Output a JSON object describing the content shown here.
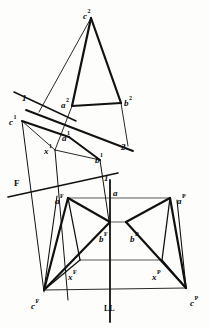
{
  "figure": {
    "ink_color": "#111111",
    "paper_color": "#fdfdfc",
    "width": 210,
    "height": 327
  },
  "labels": [
    {
      "id": "c2",
      "base": "c",
      "sup": "2",
      "x": 83,
      "y": 6,
      "italic": true
    },
    {
      "id": "a2",
      "base": "a",
      "sup": "2",
      "x": 61,
      "y": 95,
      "italic": true
    },
    {
      "id": "b2",
      "base": "b",
      "sup": "2",
      "x": 124,
      "y": 93,
      "italic": true
    },
    {
      "id": "one-upper",
      "base": "1",
      "sup": "",
      "x": 22,
      "y": 88,
      "italic": true
    },
    {
      "id": "c1",
      "base": "c",
      "sup": "1",
      "x": 9,
      "y": 112,
      "italic": true
    },
    {
      "id": "a1",
      "base": "a",
      "sup": "1",
      "x": 62,
      "y": 128,
      "italic": true
    },
    {
      "id": "x1",
      "base": "x",
      "sup": "1",
      "x": 44,
      "y": 141,
      "italic": true
    },
    {
      "id": "b1",
      "base": "b",
      "sup": "1",
      "x": 95,
      "y": 150,
      "italic": true
    },
    {
      "id": "two",
      "base": "2",
      "sup": "",
      "x": 121,
      "y": 137,
      "italic": true
    },
    {
      "id": "F-trace",
      "base": "F",
      "sup": "",
      "x": 14,
      "y": 173,
      "italic": false
    },
    {
      "id": "one-lower",
      "base": "1",
      "sup": "",
      "x": 104,
      "y": 168,
      "italic": true
    },
    {
      "id": "a-plain",
      "base": "a",
      "sup": "",
      "x": 113,
      "y": 183,
      "italic": true
    },
    {
      "id": "aF",
      "base": "a",
      "sup": "F",
      "x": 55,
      "y": 191,
      "italic": true
    },
    {
      "id": "aP",
      "base": "a",
      "sup": "P",
      "x": 177,
      "y": 191,
      "italic": true
    },
    {
      "id": "bF",
      "base": "b",
      "sup": "F",
      "x": 99,
      "y": 229,
      "italic": true
    },
    {
      "id": "bP",
      "base": "b",
      "sup": "P",
      "x": 130,
      "y": 229,
      "italic": true
    },
    {
      "id": "xF",
      "base": "x",
      "sup": "F",
      "x": 68,
      "y": 267,
      "italic": true
    },
    {
      "id": "xP",
      "base": "x",
      "sup": "P",
      "x": 152,
      "y": 267,
      "italic": true
    },
    {
      "id": "cF",
      "base": "c",
      "sup": "F",
      "x": 31,
      "y": 296,
      "italic": true
    },
    {
      "id": "cP",
      "base": "c",
      "sup": "P",
      "x": 190,
      "y": 293,
      "italic": true
    },
    {
      "id": "LL",
      "base": "LL",
      "sup": "",
      "x": 104,
      "y": 298,
      "italic": false
    }
  ],
  "chart_data": {
    "type": "diagram",
    "views": [
      {
        "name": "view-2",
        "note": "upper auxiliary view",
        "points": {
          "c2": [
            91,
            18
          ],
          "a2": [
            72,
            106
          ],
          "b2": [
            121,
            103
          ],
          "x2": [
            39,
            112
          ]
        },
        "edges": [
          [
            "c2",
            "a2",
            "heavy"
          ],
          [
            "c2",
            "b2",
            "heavy"
          ],
          [
            "a2",
            "b2",
            "heavy"
          ],
          [
            "c2",
            "x2",
            "light"
          ],
          [
            "a2",
            "x2",
            "light"
          ]
        ]
      },
      {
        "name": "view-1",
        "note": "lower auxiliary view",
        "points": {
          "c1": [
            22,
            121
          ],
          "a1": [
            69,
            137
          ],
          "b1": [
            100,
            160
          ],
          "x1": [
            55,
            150
          ],
          "p2": [
            128,
            146
          ]
        },
        "edges": [
          [
            "c1",
            "a1",
            "heavy"
          ],
          [
            "a1",
            "b1",
            "heavy"
          ],
          [
            "c1",
            "x1",
            "light"
          ],
          [
            "x1",
            "b1",
            "light"
          ]
        ]
      },
      {
        "name": "view-F",
        "note": "front view",
        "points": {
          "aF": [
            68,
            198
          ],
          "bF": [
            110,
            222
          ],
          "cF": [
            44,
            290
          ],
          "xF": [
            80,
            260
          ]
        },
        "edges": [
          [
            "aF",
            "bF",
            "heavy"
          ],
          [
            "aF",
            "cF",
            "heavy"
          ],
          [
            "bF",
            "cF",
            "heavy"
          ],
          [
            "aF",
            "xF",
            "light"
          ],
          [
            "xF",
            "cF",
            "light"
          ]
        ]
      },
      {
        "name": "view-P",
        "note": "profile view",
        "points": {
          "aP": [
            170,
            198
          ],
          "bP": [
            126,
            222
          ],
          "cP": [
            186,
            288
          ],
          "xP": [
            162,
            260
          ]
        },
        "edges": [
          [
            "aP",
            "bP",
            "heavy"
          ],
          [
            "aP",
            "cP",
            "heavy"
          ],
          [
            "bP",
            "cP",
            "heavy"
          ],
          [
            "aP",
            "xP",
            "light"
          ],
          [
            "xP",
            "cP",
            "light"
          ]
        ]
      }
    ],
    "reference_lines": [
      {
        "name": "trace-1-upper",
        "label": "1",
        "from": [
          14,
          92
        ],
        "to": [
          72,
          119
        ]
      },
      {
        "name": "trace-1-2",
        "label": "2",
        "from": [
          26,
          110
        ],
        "to": [
          133,
          151
        ]
      },
      {
        "name": "trace-F",
        "label": "F",
        "from": [
          8,
          197
        ],
        "to": [
          118,
          173
        ]
      },
      {
        "name": "ground-line-LL",
        "label": "LL",
        "from": [
          110,
          180
        ],
        "to": [
          110,
          322
        ]
      }
    ],
    "projectors": [
      {
        "from": [
          44,
          96
        ],
        "to": [
          44,
          290
        ]
      },
      {
        "from": [
          64,
          127
        ],
        "to": [
          68,
          300
        ]
      },
      {
        "from": [
          104,
          110
        ],
        "to": [
          110,
          232
        ]
      }
    ]
  }
}
